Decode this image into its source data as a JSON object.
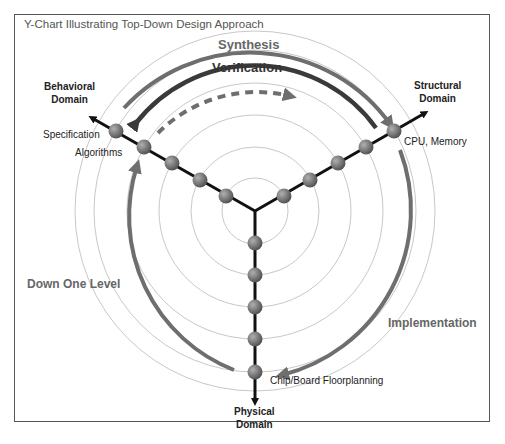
{
  "title": "Y-Chart Illustrating Top-Down Design Approach",
  "domains": {
    "behavioral": {
      "line1": "Behavioral",
      "line2": "Domain"
    },
    "structural": {
      "line1": "Structural",
      "line2": "Domain"
    },
    "physical": {
      "line1": "Physical",
      "line2": "Domain"
    }
  },
  "arrows": {
    "synthesis": "Synthesis",
    "verification": "Verification",
    "implementation": "Implementation",
    "down_one_level": "Down One Level"
  },
  "levels": {
    "specification": "Specification",
    "algorithms": "Algorithms",
    "cpu_memory": "CPU, Memory",
    "floorplanning": "Chip/Board Floorplanning"
  },
  "colors": {
    "arrow_gray": "#6e6e6e",
    "verification_dark": "#3a3a3a",
    "ring": "#c8c8c8",
    "node": "#7a7a7a",
    "axis": "#111111"
  }
}
